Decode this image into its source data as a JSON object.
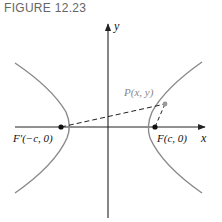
{
  "figure": {
    "label": "FIGURE 12.23",
    "type": "hyperbola-foci-diagram"
  },
  "axes": {
    "x_label": "x",
    "y_label": "y"
  },
  "points": {
    "left_focus": "F′(−c, 0)",
    "right_focus": "F(c, 0)",
    "point_p": "P(x, y)"
  },
  "colors": {
    "axis": "#222222",
    "curve": "#8a8a8a",
    "dashed": "#222222",
    "label_text": "#111111",
    "p_label": "#888888",
    "figure_label": "#666666"
  }
}
